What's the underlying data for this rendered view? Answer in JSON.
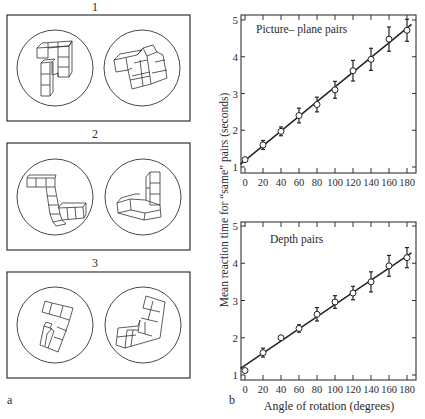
{
  "panel_a": {
    "label": "a",
    "stimuli": [
      {
        "number": "1",
        "description": "Picture-plane rotated cube figures"
      },
      {
        "number": "2",
        "description": "Depth rotated cube figures"
      },
      {
        "number": "3",
        "description": "Different (mirror) cube figures"
      }
    ]
  },
  "panel_b": {
    "label": "b",
    "ylabel": "Mean reaction time for “same” pairs (seconds)",
    "xlabel": "Angle of rotation (degrees)"
  },
  "chart_data": [
    {
      "type": "scatter",
      "title": "Picture– plane pairs",
      "xlabel": "",
      "ylabel": "Mean reaction time for “same” pairs (seconds)",
      "x": [
        0,
        20,
        40,
        60,
        80,
        100,
        120,
        140,
        160,
        180
      ],
      "xticks": [
        "0",
        "20",
        "40",
        "60",
        "80",
        "100",
        "120",
        "140",
        "160",
        "180"
      ],
      "yticks": [
        "1",
        "2",
        "3",
        "4",
        "5"
      ],
      "series": [
        {
          "name": "Mean RT",
          "values": [
            1.2,
            1.6,
            1.97,
            2.4,
            2.7,
            3.1,
            3.62,
            3.93,
            4.48,
            4.72
          ]
        },
        {
          "name": "Error",
          "values": [
            0.05,
            0.12,
            0.12,
            0.2,
            0.2,
            0.23,
            0.28,
            0.3,
            0.33,
            0.3
          ]
        }
      ],
      "fit_line": {
        "x0": -5,
        "y0": 1.08,
        "x1": 185,
        "y1": 4.88
      },
      "xlim": [
        -5,
        185
      ],
      "ylim": [
        1,
        5.15
      ],
      "grid": false
    },
    {
      "type": "scatter",
      "title": "Depth pairs",
      "xlabel": "Angle of rotation (degrees)",
      "ylabel": "Mean reaction time for “same” pairs (seconds)",
      "x": [
        0,
        20,
        40,
        60,
        80,
        100,
        120,
        140,
        160,
        180
      ],
      "xticks": [
        "0",
        "20",
        "40",
        "60",
        "80",
        "100",
        "120",
        "140",
        "160",
        "180"
      ],
      "yticks": [
        "1",
        "2",
        "3",
        "4",
        "5"
      ],
      "series": [
        {
          "name": "Mean RT",
          "values": [
            1.12,
            1.6,
            2.0,
            2.25,
            2.63,
            2.96,
            3.2,
            3.5,
            3.93,
            4.15
          ]
        },
        {
          "name": "Error",
          "values": [
            0.0,
            0.12,
            0.0,
            0.1,
            0.18,
            0.17,
            0.18,
            0.27,
            0.28,
            0.27
          ]
        }
      ],
      "fit_line": {
        "x0": -5,
        "y0": 1.18,
        "x1": 185,
        "y1": 4.28
      },
      "xlim": [
        -5,
        185
      ],
      "ylim": [
        1,
        5.15
      ],
      "grid": false
    }
  ]
}
